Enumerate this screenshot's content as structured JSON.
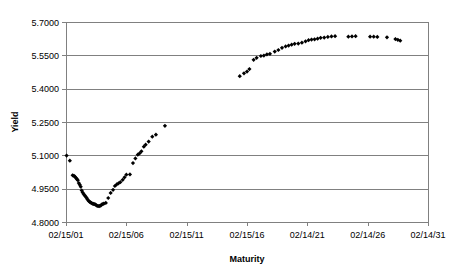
{
  "chart_data": {
    "type": "scatter",
    "title": "",
    "xlabel": "Maturity",
    "ylabel": "Yield",
    "grid": true,
    "legend": "none",
    "marker": "diamond",
    "marker_color": "#000000",
    "xlim": [
      0,
      30
    ],
    "ylim": [
      4.8,
      5.7
    ],
    "yticks": [
      4.8,
      4.95,
      5.1,
      5.25,
      5.4,
      5.55,
      5.7
    ],
    "ytick_labels": [
      "4.8000",
      "4.9500",
      "5.1000",
      "5.2500",
      "5.4000",
      "5.5500",
      "5.7000"
    ],
    "xticks": [
      0,
      5,
      10,
      15,
      20,
      25,
      30
    ],
    "xtick_labels": [
      "02/15/01",
      "02/15/06",
      "02/15/11",
      "02/15/16",
      "02/14/21",
      "02/14/26",
      "02/14/31"
    ],
    "series": [
      {
        "name": "Yield curve",
        "points": [
          [
            0.05,
            5.099
          ],
          [
            0.32,
            5.076
          ],
          [
            0.55,
            5.01
          ],
          [
            0.66,
            5.008
          ],
          [
            0.74,
            5.004
          ],
          [
            0.82,
            4.999
          ],
          [
            0.9,
            4.993
          ],
          [
            0.98,
            4.988
          ],
          [
            1.06,
            4.975
          ],
          [
            1.14,
            4.968
          ],
          [
            1.22,
            4.959
          ],
          [
            1.3,
            4.942
          ],
          [
            1.38,
            4.933
          ],
          [
            1.46,
            4.926
          ],
          [
            1.54,
            4.92
          ],
          [
            1.62,
            4.915
          ],
          [
            1.7,
            4.909
          ],
          [
            1.78,
            4.902
          ],
          [
            1.86,
            4.896
          ],
          [
            1.94,
            4.892
          ],
          [
            2.02,
            4.888
          ],
          [
            2.1,
            4.886
          ],
          [
            2.18,
            4.883
          ],
          [
            2.26,
            4.882
          ],
          [
            2.34,
            4.88
          ],
          [
            2.42,
            4.879
          ],
          [
            2.5,
            4.876
          ],
          [
            2.58,
            4.873
          ],
          [
            2.66,
            4.872
          ],
          [
            2.74,
            4.871
          ],
          [
            2.82,
            4.873
          ],
          [
            2.9,
            4.875
          ],
          [
            2.98,
            4.879
          ],
          [
            3.06,
            4.881
          ],
          [
            3.14,
            4.883
          ],
          [
            3.3,
            4.886
          ],
          [
            3.5,
            4.908
          ],
          [
            3.7,
            4.931
          ],
          [
            3.9,
            4.945
          ],
          [
            4.05,
            4.962
          ],
          [
            4.2,
            4.969
          ],
          [
            4.35,
            4.974
          ],
          [
            4.5,
            4.979
          ],
          [
            4.7,
            4.99
          ],
          [
            4.85,
            5.001
          ],
          [
            5.0,
            5.013
          ],
          [
            5.3,
            5.014
          ],
          [
            5.55,
            5.065
          ],
          [
            5.75,
            5.086
          ],
          [
            5.95,
            5.103
          ],
          [
            6.1,
            5.109
          ],
          [
            6.25,
            5.118
          ],
          [
            6.45,
            5.139
          ],
          [
            6.6,
            5.148
          ],
          [
            6.85,
            5.162
          ],
          [
            7.15,
            5.184
          ],
          [
            7.45,
            5.193
          ],
          [
            8.2,
            5.233
          ],
          [
            14.4,
            5.456
          ],
          [
            14.75,
            5.469
          ],
          [
            15.0,
            5.477
          ],
          [
            15.2,
            5.488
          ],
          [
            15.55,
            5.53
          ],
          [
            15.8,
            5.539
          ],
          [
            16.15,
            5.547
          ],
          [
            16.4,
            5.549
          ],
          [
            16.65,
            5.554
          ],
          [
            16.9,
            5.557
          ],
          [
            17.3,
            5.567
          ],
          [
            17.6,
            5.574
          ],
          [
            17.9,
            5.584
          ],
          [
            18.2,
            5.59
          ],
          [
            18.45,
            5.594
          ],
          [
            18.7,
            5.598
          ],
          [
            18.95,
            5.602
          ],
          [
            19.25,
            5.603
          ],
          [
            19.55,
            5.607
          ],
          [
            19.85,
            5.613
          ],
          [
            20.1,
            5.618
          ],
          [
            20.35,
            5.621
          ],
          [
            20.6,
            5.622
          ],
          [
            20.85,
            5.625
          ],
          [
            21.1,
            5.629
          ],
          [
            21.4,
            5.63
          ],
          [
            21.7,
            5.633
          ],
          [
            22.0,
            5.635
          ],
          [
            22.3,
            5.636
          ],
          [
            23.4,
            5.634
          ],
          [
            23.7,
            5.635
          ],
          [
            24.0,
            5.636
          ],
          [
            25.2,
            5.634
          ],
          [
            25.5,
            5.634
          ],
          [
            25.8,
            5.633
          ],
          [
            26.6,
            5.631
          ],
          [
            27.3,
            5.623
          ],
          [
            27.5,
            5.62
          ],
          [
            27.7,
            5.616
          ]
        ]
      }
    ]
  },
  "labels": {
    "y_axis_title": "Yield",
    "x_axis_title": "Maturity"
  }
}
